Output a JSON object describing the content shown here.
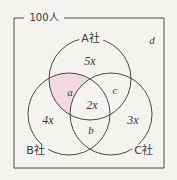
{
  "figure": {
    "type": "venn-diagram-3-set",
    "universe_label": "100人",
    "outside_label": "d",
    "colors": {
      "stroke": "#4a4a4a",
      "highlight_fill": "#f0d9e1",
      "background": "#f4f3ef",
      "text": "#3a3a3a"
    },
    "sets": [
      {
        "id": "A",
        "label": "A社",
        "cx": 90,
        "cy": 79,
        "r": 41
      },
      {
        "id": "B",
        "label": "B社",
        "cx": 69,
        "cy": 114,
        "r": 41
      },
      {
        "id": "C",
        "label": "C社",
        "cx": 111,
        "cy": 114,
        "r": 41
      }
    ],
    "regions": [
      {
        "id": "A-only",
        "label": "5x",
        "x": 90,
        "y": 61,
        "shaded": false
      },
      {
        "id": "B-only",
        "label": "4x",
        "x": 48,
        "y": 120,
        "shaded": false
      },
      {
        "id": "C-only",
        "label": "3x",
        "x": 133,
        "y": 120,
        "shaded": false
      },
      {
        "id": "A-and-B",
        "label": "a",
        "x": 70,
        "y": 92,
        "shaded": true
      },
      {
        "id": "A-and-C",
        "label": "c",
        "x": 115,
        "y": 90,
        "shaded": false
      },
      {
        "id": "B-and-C",
        "label": "b",
        "x": 91,
        "y": 130,
        "shaded": false
      },
      {
        "id": "A-B-and-C",
        "label": "2x",
        "x": 92,
        "y": 105,
        "shaded": false
      }
    ],
    "set_label_positions": [
      {
        "id": "A",
        "x": 91,
        "y": 38
      },
      {
        "id": "B",
        "x": 36,
        "y": 150
      },
      {
        "id": "C",
        "x": 144,
        "y": 150
      }
    ],
    "outside_label_position": {
      "x": 152,
      "y": 40
    },
    "frame": {
      "left": 14,
      "top": 18,
      "right": 164,
      "bottom": 168
    }
  }
}
